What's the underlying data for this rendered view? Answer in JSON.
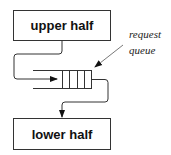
{
  "diagram": {
    "upper_box": {
      "label": "upper half"
    },
    "lower_box": {
      "label": "lower half"
    },
    "queue": {
      "cells": 4
    },
    "annotation": {
      "line1": "request",
      "line2": "queue"
    }
  }
}
